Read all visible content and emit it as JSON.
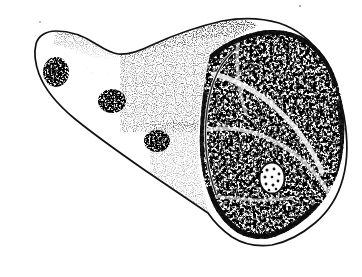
{
  "figure": {
    "domain": "Natural-Image",
    "medium": "pen-and-ink stipple line drawing",
    "caption": "",
    "background_color": "#ffffff",
    "ink_color": "#0d0d0d",
    "canvas": {
      "width": 362,
      "height": 277
    }
  },
  "regions": {
    "outline": {
      "name": "specimen-outline",
      "description": "closed contour of the whole bone fragment",
      "stroke_color": "#111111",
      "stroke_width": 1.6,
      "bounds": {
        "x": 33,
        "y": 18,
        "width": 315,
        "height": 228
      },
      "path": "M 36 44 C 38 36 46 31 56 31 C 70 31 84 36 96 44 C 104 49 110 53 118 54 C 128 55 140 51 152 45 C 176 34 200 26 222 21 C 243 17 262 18 279 23 C 297 29 312 41 322 57 C 333 74 340 95 344 116 C 348 139 348 160 343 178 C 338 197 328 212 315 223 C 302 234 287 242 272 245 C 257 247 243 244 232 237 C 222 230 214 222 208 213 C 190 201 168 186 146 171 C 120 153 96 136 75 119 C 58 105 45 90 39 74 C 35 63 34 52 36 44 Z"
    },
    "cortical_surface": {
      "name": "cortical-stipple-field",
      "description": "light outer bone surface rendered in graded stipple dots; dense near the upper-right, sparse toward the left tip",
      "fill_color": "#ffffff",
      "dot_color": "#141414"
    },
    "trabecular_section": {
      "name": "trabecular-cross-section",
      "description": "dark reticular cancellous (spongy) bone exposed at the broken end",
      "fill_color": "#101010",
      "texture": "irregular reticular mesh of short ink strokes with white interstices",
      "rim_line": "pale channel separating the cortical rim from the trabecular core",
      "path": "M 210 55 C 222 44 238 36 256 32 C 274 28 291 30 306 39 C 320 48 331 63 337 82 C 344 104 346 128 343 150 C 340 173 331 193 317 208 C 303 223 286 234 270 238 C 254 241 240 236 230 227 C 219 217 212 205 208 192 C 202 174 199 154 200 132 C 201 108 204 79 210 55 Z"
    },
    "foramen": {
      "name": "nutrient-foramen",
      "description": "small pale oval opening inside the trabecular field, stippled inside",
      "center": {
        "x": 272,
        "y": 178
      },
      "radius_x": 12,
      "radius_y": 15,
      "fill_color": "#fdfdfd",
      "stroke_color": "#101010",
      "interior_dots": 11
    },
    "dark_smudges": [
      {
        "name": "smudge-left-tip",
        "x": 46,
        "y": 60,
        "width": 22,
        "height": 26
      },
      {
        "name": "smudge-mid-upper",
        "x": 104,
        "y": 92,
        "width": 26,
        "height": 22
      },
      {
        "name": "smudge-mid-lower",
        "x": 148,
        "y": 132,
        "width": 24,
        "height": 20
      }
    ]
  },
  "annotations": {
    "labels": [],
    "scale_bar": null,
    "arrows": []
  }
}
